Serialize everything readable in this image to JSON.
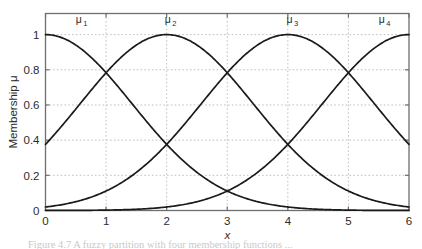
{
  "figure": {
    "background_color": "#ffffff",
    "frame_color": "#6e6e6e",
    "curve_color": "#1a1a1a",
    "grid_color": "#b9b9b9",
    "caption_partial": "Figure 4.7 A fuzzy partition with four membership functions ..."
  },
  "chart_data": {
    "type": "line",
    "title": "",
    "xlabel": "x",
    "ylabel": "Membership μ",
    "xlim": [
      0,
      6
    ],
    "ylim": [
      0,
      1.12
    ],
    "xticks": [
      0,
      1,
      2,
      3,
      4,
      5,
      6
    ],
    "xtick_labels": [
      "0",
      "1",
      "2",
      "3",
      "4",
      "5",
      "6"
    ],
    "yticks": [
      0,
      0.2,
      0.4,
      0.6,
      0.8,
      1
    ],
    "ytick_labels": [
      "0",
      "0.2",
      "0.4",
      "0.6",
      "0.8",
      "1"
    ],
    "grid": true,
    "grid_style": "dotted",
    "legend": "inline-annotations",
    "annotations": [
      {
        "text": "μ",
        "sub": "1",
        "x": 0.55,
        "y": 1.065
      },
      {
        "text": "μ",
        "sub": "2",
        "x": 2.02,
        "y": 1.065
      },
      {
        "text": "μ",
        "sub": "3",
        "x": 4.03,
        "y": 1.065
      },
      {
        "text": "μ",
        "sub": "4",
        "x": 5.55,
        "y": 1.065
      }
    ],
    "series": [
      {
        "name": "μ1",
        "center": 0,
        "sigma": 1.43,
        "x": [
          0,
          0.25,
          0.5,
          0.75,
          1,
          1.25,
          1.5,
          1.75,
          2,
          2.25,
          2.5,
          2.75,
          3,
          3.25,
          3.5,
          3.75,
          4,
          4.25,
          4.5,
          4.75,
          5,
          5.25,
          5.5,
          5.75,
          6
        ],
        "values": [
          1.0,
          0.985,
          0.941,
          0.872,
          0.784,
          0.684,
          0.578,
          0.473,
          0.375,
          0.287,
          0.213,
          0.152,
          0.106,
          0.071,
          0.046,
          0.029,
          0.018,
          0.011,
          0.006,
          0.003,
          0.002,
          0.001,
          0.0005,
          0.0002,
          0.0001
        ]
      },
      {
        "name": "μ2",
        "center": 2,
        "sigma": 1.43,
        "x": [
          0,
          0.25,
          0.5,
          0.75,
          1,
          1.25,
          1.5,
          1.75,
          2,
          2.25,
          2.5,
          2.75,
          3,
          3.25,
          3.5,
          3.75,
          4,
          4.25,
          4.5,
          4.75,
          5,
          5.25,
          5.5,
          5.75,
          6
        ],
        "values": [
          0.375,
          0.473,
          0.578,
          0.684,
          0.784,
          0.872,
          0.941,
          0.985,
          1.0,
          0.985,
          0.941,
          0.872,
          0.784,
          0.684,
          0.578,
          0.473,
          0.375,
          0.287,
          0.213,
          0.152,
          0.106,
          0.071,
          0.046,
          0.029,
          0.018
        ]
      },
      {
        "name": "μ3",
        "center": 4,
        "sigma": 1.43,
        "x": [
          0,
          0.25,
          0.5,
          0.75,
          1,
          1.25,
          1.5,
          1.75,
          2,
          2.25,
          2.5,
          2.75,
          3,
          3.25,
          3.5,
          3.75,
          4,
          4.25,
          4.5,
          4.75,
          5,
          5.25,
          5.5,
          5.75,
          6
        ],
        "values": [
          0.018,
          0.029,
          0.046,
          0.071,
          0.106,
          0.152,
          0.213,
          0.287,
          0.375,
          0.473,
          0.578,
          0.684,
          0.784,
          0.872,
          0.941,
          0.985,
          1.0,
          0.985,
          0.941,
          0.872,
          0.784,
          0.684,
          0.578,
          0.473,
          0.375
        ]
      },
      {
        "name": "μ4",
        "center": 6,
        "sigma": 1.43,
        "x": [
          0,
          0.25,
          0.5,
          0.75,
          1,
          1.25,
          1.5,
          1.75,
          2,
          2.25,
          2.5,
          2.75,
          3,
          3.25,
          3.5,
          3.75,
          4,
          4.25,
          4.5,
          4.75,
          5,
          5.25,
          5.5,
          5.75,
          6
        ],
        "values": [
          0.0001,
          0.0002,
          0.0005,
          0.001,
          0.002,
          0.003,
          0.006,
          0.011,
          0.018,
          0.029,
          0.046,
          0.071,
          0.106,
          0.152,
          0.213,
          0.287,
          0.375,
          0.473,
          0.578,
          0.684,
          0.784,
          0.872,
          0.941,
          0.985,
          1.0
        ]
      }
    ],
    "crossings": [
      {
        "x": 1,
        "y": 0.9
      },
      {
        "x": 2,
        "y": 0.65
      },
      {
        "x": 3,
        "y": 0.9
      },
      {
        "x": 3,
        "y": 0.39
      },
      {
        "x": 4,
        "y": 0.65
      },
      {
        "x": 5,
        "y": 0.9
      }
    ]
  }
}
